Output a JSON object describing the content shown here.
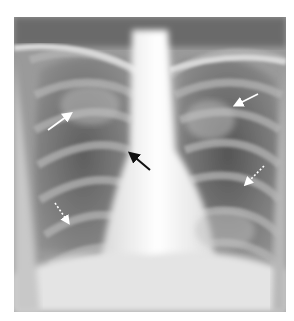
{
  "image": {
    "type": "chest-radiograph",
    "view": "frontal (PA)",
    "description": "Frontal chest X-ray with hazy bilateral lung opacities, widened white mediastinum, and annotation arrows"
  },
  "annotations": [
    {
      "id": "arrow-right-upper",
      "style": "solid",
      "color": "#ffffff",
      "from": [
        48,
        130
      ],
      "to": [
        72,
        113
      ]
    },
    {
      "id": "arrow-left-upper",
      "style": "solid",
      "color": "#ffffff",
      "from": [
        258,
        94
      ],
      "to": [
        234,
        106
      ]
    },
    {
      "id": "arrow-hilum",
      "style": "solid",
      "color": "#111111",
      "from": [
        150,
        170
      ],
      "to": [
        129,
        152
      ]
    },
    {
      "id": "arrow-right-lower",
      "style": "dashed",
      "color": "#ffffff",
      "from": [
        55,
        203
      ],
      "to": [
        69,
        224
      ]
    },
    {
      "id": "arrow-left-lower",
      "style": "dashed",
      "color": "#ffffff",
      "from": [
        264,
        166
      ],
      "to": [
        244,
        186
      ]
    }
  ]
}
